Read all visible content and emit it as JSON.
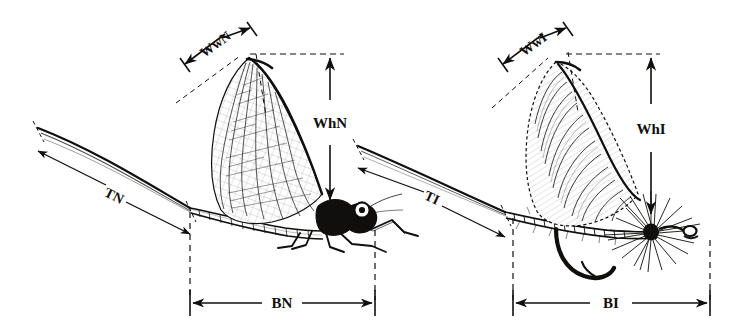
{
  "figure": {
    "title_strip": "",
    "background_color": "#ffffff",
    "ink_color": "#100f0d",
    "specimens": [
      {
        "id": "natural-mayfly",
        "name": "natural mayfly",
        "side": "left",
        "measurements": [
          "WwN",
          "WhN",
          "TN",
          "BN"
        ]
      },
      {
        "id": "artificial-fly",
        "name": "artificial fly imitation",
        "side": "right",
        "measurements": [
          "WwI",
          "WhI",
          "TI",
          "BI"
        ]
      }
    ]
  },
  "labels": {
    "wing_width_natural": "WwN",
    "wing_height_natural": "WhN",
    "tail_natural": "TN",
    "body_natural": "BN",
    "wing_width_imitation": "WwI",
    "wing_height_imitation": "WhI",
    "tail_imitation": "TI",
    "body_imitation": "BI"
  }
}
